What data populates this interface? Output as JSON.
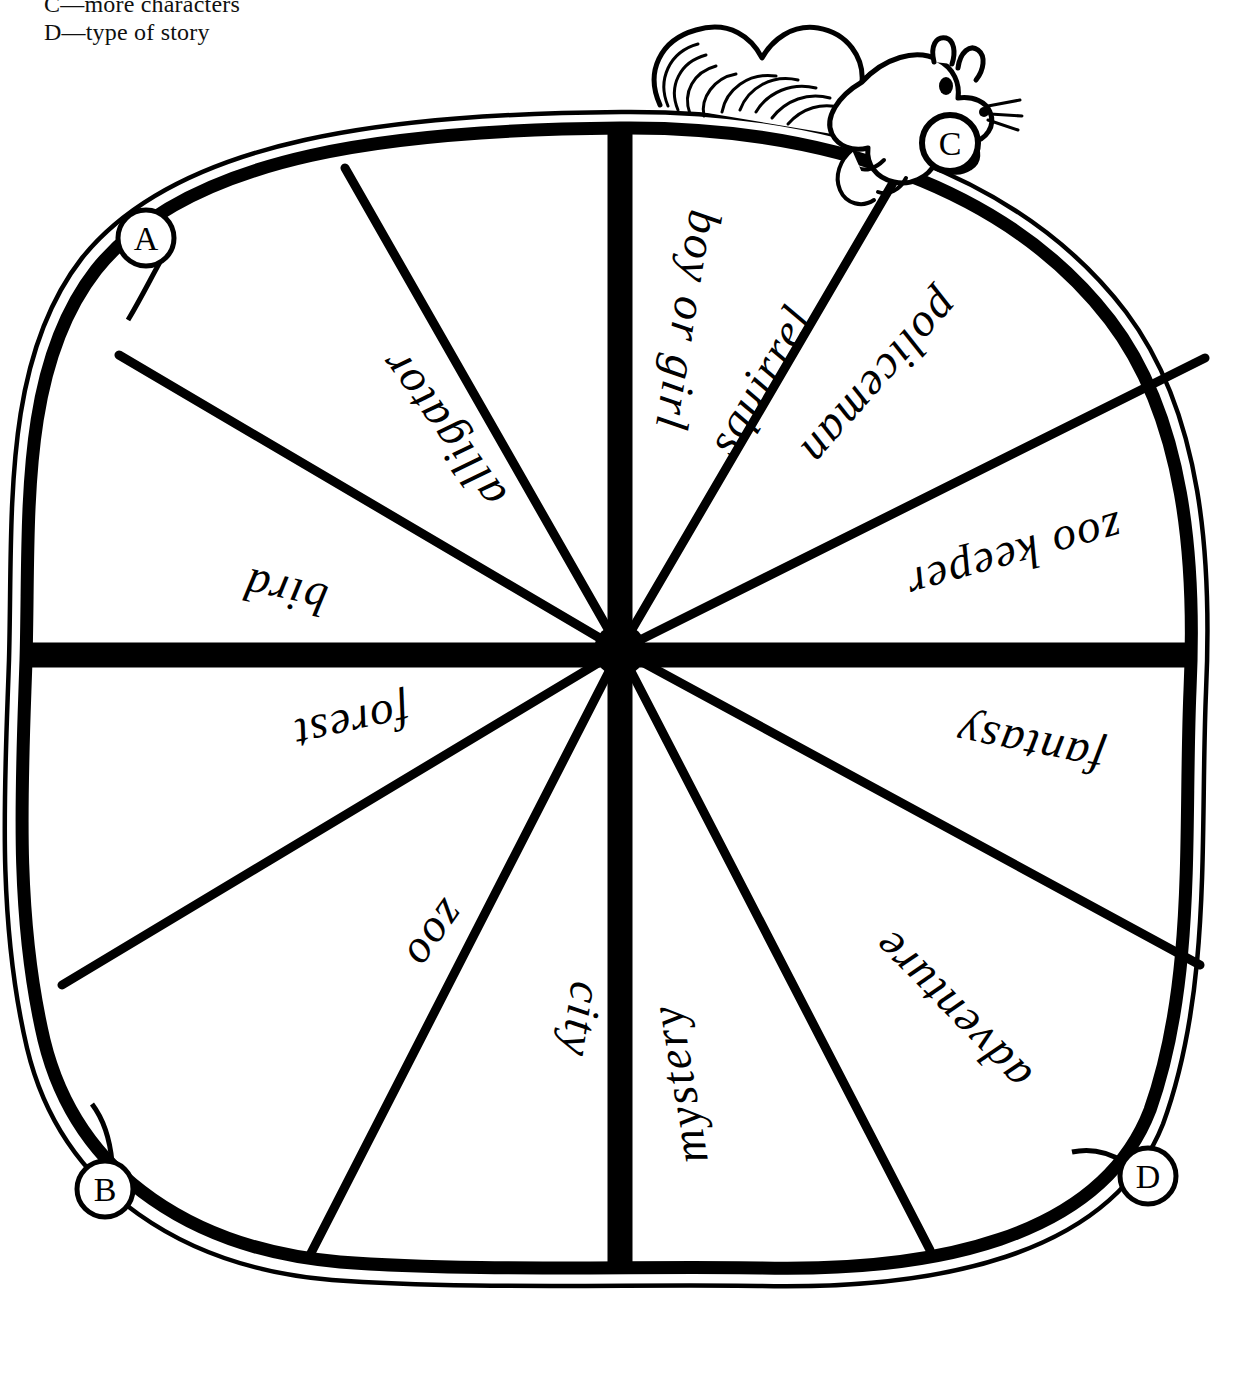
{
  "legend": {
    "lines": [
      "C—more characters",
      "D—type of story"
    ]
  },
  "wheel": {
    "title": "story starter spinner wheel",
    "center_hub": "hub",
    "segment_count": 12,
    "ink_color": "#000000",
    "paper_color": "#ffffff",
    "segments": [
      {
        "label": "squirrel",
        "quadrant": "A",
        "index": 0
      },
      {
        "label": "alligator",
        "quadrant": "A",
        "index": 1
      },
      {
        "label": "bird",
        "quadrant": "A",
        "index": 2
      },
      {
        "label": "forest",
        "quadrant": "B",
        "index": 3
      },
      {
        "label": "zoo",
        "quadrant": "B",
        "index": 4
      },
      {
        "label": "city",
        "quadrant": "B",
        "index": 5
      },
      {
        "label": "mystery",
        "quadrant": "D",
        "index": 6
      },
      {
        "label": "adventure",
        "quadrant": "D",
        "index": 7
      },
      {
        "label": "fantasy",
        "quadrant": "D",
        "index": 8
      },
      {
        "label": "zoo keeper",
        "quadrant": "C",
        "index": 9
      },
      {
        "label": "policeman",
        "quadrant": "C",
        "index": 10
      },
      {
        "label": "boy or girl",
        "quadrant": "C",
        "index": 11
      }
    ],
    "markers": [
      {
        "letter": "A",
        "x": 146,
        "y": 238
      },
      {
        "letter": "B",
        "x": 105,
        "y": 1189
      },
      {
        "letter": "C",
        "x": 950,
        "y": 143
      },
      {
        "letter": "D",
        "x": 1148,
        "y": 1176
      }
    ],
    "squirrel": {
      "name": "squirrel-illustration",
      "description": "hand drawn squirrel with bushy tail holding the C marker"
    }
  }
}
